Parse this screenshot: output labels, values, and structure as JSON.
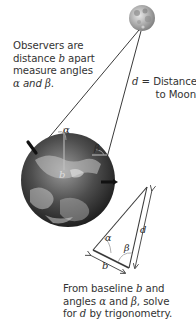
{
  "figure": {
    "moon": {
      "label": "Moon"
    },
    "earth": {
      "label": "Earth"
    },
    "captions": {
      "observers": {
        "line1": "Observers are",
        "line2_pre": "distance ",
        "line2_var": "b",
        "line2_post": " apart",
        "line3": "measure angles",
        "line4_var1": "α",
        "line4_mid": " and ",
        "line4_var2": "β",
        "line4_post": "."
      },
      "distance": {
        "var": "d",
        "line1_post": " = Distance",
        "line2": "to Moon"
      },
      "baseline": {
        "line1_pre": "From baseline ",
        "line1_var": "b",
        "line1_post": " and",
        "line2_pre": "angles ",
        "line2_var1": "α",
        "line2_mid": " and ",
        "line2_var2": "β",
        "line2_post": ", solve",
        "line3_pre": "for ",
        "line3_var": "d",
        "line3_post": " by trigonometry."
      }
    },
    "labels": {
      "alpha": "α",
      "beta": "β",
      "b": "b",
      "d": "d"
    },
    "colors": {
      "line": "#3a3a3a",
      "angle_arc": "#b0b0b0",
      "text": "#333333"
    }
  }
}
